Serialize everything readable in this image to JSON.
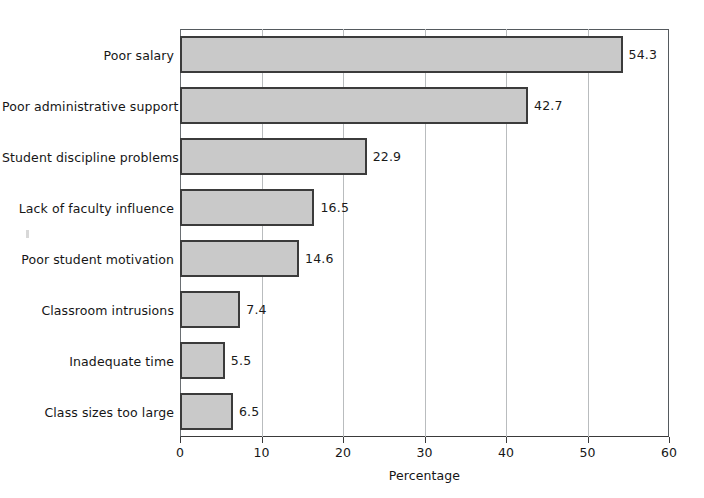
{
  "chart_data": {
    "type": "bar",
    "orientation": "horizontal",
    "title": "",
    "xlabel": "Percentage",
    "ylabel": "",
    "xlim": [
      0,
      60
    ],
    "xticks": [
      0,
      10,
      20,
      30,
      40,
      50,
      60
    ],
    "xtick_labels": [
      "0",
      "10",
      "20",
      "30",
      "40",
      "50",
      "60"
    ],
    "grid": "vertical",
    "legend": "none",
    "categories": [
      "Poor salary",
      "Poor administrative support",
      "Student discipline problems",
      "Lack of faculty influence",
      "Poor student motivation",
      "Classroom intrusions",
      "Inadequate time",
      "Class sizes too large"
    ],
    "values": [
      54.3,
      42.7,
      22.9,
      16.5,
      14.6,
      7.4,
      5.5,
      6.5
    ],
    "value_labels": [
      "54.3",
      "42.7",
      "22.9",
      "16.5",
      "14.6",
      "7.4",
      "5.5",
      "6.5"
    ],
    "colors": {
      "bar_fill": "#c9c9c9",
      "bar_border": "#3b3b3b",
      "gridline": "#b9bcbe",
      "axis": "#3a3a3a",
      "text": "#161616",
      "background": "#ffffff"
    }
  }
}
